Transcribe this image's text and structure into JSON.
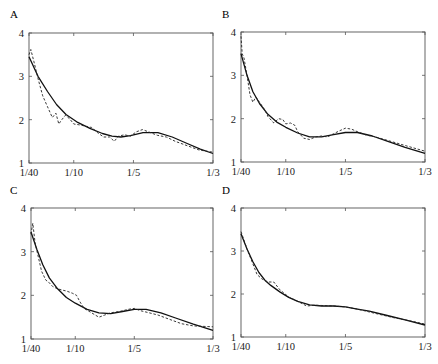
{
  "chart_data": [
    {
      "type": "line",
      "panel": "A",
      "title": "A",
      "xlabel": "",
      "ylabel": "",
      "xlim": [
        0.025,
        0.3333
      ],
      "ylim": [
        1,
        4
      ],
      "xticks": [
        0.025,
        0.1,
        0.2,
        0.3333
      ],
      "xtick_labels": [
        "1/40",
        "1/10",
        "1/5",
        "1/3"
      ],
      "yticks": [
        1,
        2,
        3,
        4
      ],
      "ytick_labels": [
        "1",
        "2",
        "3",
        "4"
      ],
      "grid": false,
      "series": [
        {
          "name": "solid",
          "style": "solid",
          "x": [
            0.025,
            0.04,
            0.056,
            0.071,
            0.087,
            0.105,
            0.127,
            0.148,
            0.164,
            0.179,
            0.195,
            0.216,
            0.241,
            0.265,
            0.29,
            0.312,
            0.3333
          ],
          "y": [
            3.45,
            3.0,
            2.65,
            2.35,
            2.12,
            1.95,
            1.8,
            1.68,
            1.62,
            1.6,
            1.63,
            1.7,
            1.7,
            1.6,
            1.45,
            1.32,
            1.22
          ]
        },
        {
          "name": "dashed",
          "style": "dashed",
          "x": [
            0.025,
            0.028,
            0.033,
            0.04,
            0.048,
            0.056,
            0.064,
            0.07,
            0.075,
            0.08,
            0.086,
            0.093,
            0.1,
            0.11,
            0.12,
            0.13,
            0.14,
            0.15,
            0.16,
            0.168,
            0.175,
            0.185,
            0.195,
            0.205,
            0.215,
            0.225,
            0.24,
            0.255,
            0.27,
            0.29,
            0.31,
            0.3333
          ],
          "y": [
            3.5,
            3.62,
            3.35,
            2.95,
            2.55,
            2.3,
            2.05,
            2.15,
            1.9,
            2.0,
            2.1,
            2.02,
            1.9,
            1.88,
            1.85,
            1.82,
            1.7,
            1.6,
            1.6,
            1.5,
            1.62,
            1.65,
            1.62,
            1.72,
            1.77,
            1.72,
            1.64,
            1.6,
            1.5,
            1.4,
            1.3,
            1.25
          ]
        }
      ]
    },
    {
      "type": "line",
      "panel": "B",
      "title": "B",
      "xlim": [
        0.025,
        0.3333
      ],
      "ylim": [
        1,
        4
      ],
      "xticks": [
        0.025,
        0.1,
        0.2,
        0.3333
      ],
      "xtick_labels": [
        "1/40",
        "1/10",
        "1/5",
        "1/3"
      ],
      "yticks": [
        1,
        2,
        3,
        4
      ],
      "ytick_labels": [
        "1",
        "2",
        "3",
        "4"
      ],
      "grid": false,
      "series": [
        {
          "name": "solid",
          "style": "solid",
          "x": [
            0.025,
            0.035,
            0.045,
            0.056,
            0.07,
            0.085,
            0.1,
            0.12,
            0.14,
            0.16,
            0.18,
            0.2,
            0.22,
            0.245,
            0.27,
            0.3,
            0.3333
          ],
          "y": [
            3.5,
            3.0,
            2.62,
            2.35,
            2.1,
            1.92,
            1.8,
            1.67,
            1.58,
            1.58,
            1.63,
            1.68,
            1.68,
            1.6,
            1.48,
            1.34,
            1.2
          ]
        },
        {
          "name": "dashed",
          "style": "dashed",
          "x": [
            0.025,
            0.027,
            0.03,
            0.035,
            0.04,
            0.045,
            0.05,
            0.055,
            0.06,
            0.065,
            0.07,
            0.08,
            0.088,
            0.095,
            0.1,
            0.108,
            0.115,
            0.12,
            0.13,
            0.14,
            0.15,
            0.16,
            0.17,
            0.18,
            0.19,
            0.2,
            0.21,
            0.22,
            0.235,
            0.25,
            0.27,
            0.3,
            0.3333
          ],
          "y": [
            3.9,
            3.5,
            3.4,
            3.0,
            2.55,
            2.38,
            2.5,
            2.4,
            2.3,
            2.2,
            2.05,
            1.9,
            2.0,
            1.98,
            1.88,
            1.9,
            1.85,
            1.7,
            1.55,
            1.52,
            1.58,
            1.6,
            1.58,
            1.65,
            1.72,
            1.78,
            1.76,
            1.7,
            1.62,
            1.58,
            1.5,
            1.38,
            1.25
          ]
        }
      ]
    },
    {
      "type": "line",
      "panel": "C",
      "title": "C",
      "xlim": [
        0.025,
        0.3333
      ],
      "ylim": [
        1,
        4
      ],
      "xticks": [
        0.025,
        0.1,
        0.2,
        0.3333
      ],
      "xtick_labels": [
        "1/40",
        "1/10",
        "1/5",
        "1/3"
      ],
      "yticks": [
        1,
        2,
        3,
        4
      ],
      "ytick_labels": [
        "1",
        "2",
        "3",
        "4"
      ],
      "grid": false,
      "series": [
        {
          "name": "solid",
          "style": "solid",
          "x": [
            0.025,
            0.035,
            0.045,
            0.056,
            0.07,
            0.085,
            0.1,
            0.12,
            0.14,
            0.16,
            0.18,
            0.2,
            0.22,
            0.245,
            0.27,
            0.3,
            0.3333
          ],
          "y": [
            3.45,
            3.05,
            2.7,
            2.4,
            2.15,
            1.95,
            1.82,
            1.68,
            1.6,
            1.58,
            1.63,
            1.68,
            1.68,
            1.6,
            1.48,
            1.34,
            1.2
          ]
        },
        {
          "name": "dashed",
          "style": "dashed",
          "x": [
            0.025,
            0.028,
            0.032,
            0.037,
            0.043,
            0.05,
            0.055,
            0.062,
            0.07,
            0.078,
            0.085,
            0.095,
            0.102,
            0.108,
            0.115,
            0.125,
            0.14,
            0.15,
            0.16,
            0.175,
            0.19,
            0.2,
            0.21,
            0.225,
            0.24,
            0.26,
            0.28,
            0.3,
            0.3333
          ],
          "y": [
            3.4,
            3.65,
            3.2,
            2.9,
            2.55,
            2.35,
            2.3,
            2.2,
            2.15,
            2.12,
            2.1,
            2.05,
            2.0,
            1.85,
            1.7,
            1.62,
            1.5,
            1.55,
            1.6,
            1.63,
            1.68,
            1.7,
            1.65,
            1.6,
            1.55,
            1.45,
            1.35,
            1.3,
            1.28
          ]
        }
      ]
    },
    {
      "type": "line",
      "panel": "D",
      "title": "D",
      "xlim": [
        0.025,
        0.3333
      ],
      "ylim": [
        1,
        4
      ],
      "xticks": [
        0.025,
        0.1,
        0.2,
        0.3333
      ],
      "xtick_labels": [
        "1/40",
        "1/10",
        "1/5",
        "1/3"
      ],
      "yticks": [
        1,
        2,
        3,
        4
      ],
      "ytick_labels": [
        "1",
        "2",
        "3",
        "4"
      ],
      "grid": false,
      "series": [
        {
          "name": "solid",
          "style": "solid",
          "x": [
            0.025,
            0.035,
            0.045,
            0.055,
            0.065,
            0.075,
            0.09,
            0.105,
            0.12,
            0.14,
            0.16,
            0.18,
            0.2,
            0.22,
            0.24,
            0.27,
            0.3,
            0.3333
          ],
          "y": [
            3.4,
            3.05,
            2.75,
            2.5,
            2.32,
            2.2,
            2.05,
            1.92,
            1.83,
            1.75,
            1.72,
            1.72,
            1.7,
            1.65,
            1.6,
            1.5,
            1.4,
            1.28
          ]
        },
        {
          "name": "dashed",
          "style": "dashed",
          "x": [
            0.025,
            0.035,
            0.045,
            0.052,
            0.06,
            0.07,
            0.08,
            0.09,
            0.105,
            0.12,
            0.135,
            0.15,
            0.165,
            0.18,
            0.2,
            0.22,
            0.25,
            0.28,
            0.3,
            0.3333
          ],
          "y": [
            3.45,
            3.05,
            2.7,
            2.45,
            2.35,
            2.28,
            2.28,
            2.1,
            1.93,
            1.83,
            1.72,
            1.74,
            1.73,
            1.72,
            1.7,
            1.65,
            1.55,
            1.45,
            1.4,
            1.3
          ]
        }
      ]
    }
  ],
  "panels": [
    {
      "label": "A"
    },
    {
      "label": "B"
    },
    {
      "label": "C"
    },
    {
      "label": "D"
    }
  ]
}
